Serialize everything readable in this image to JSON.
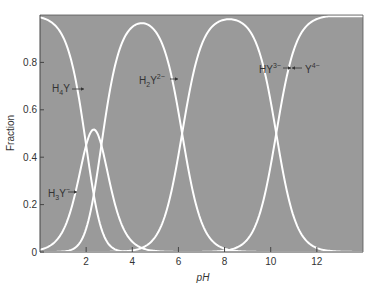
{
  "chart_data": {
    "type": "line",
    "title": "",
    "xlabel": "pH",
    "ylabel": "Fraction",
    "xlim": [
      0,
      14
    ],
    "ylim": [
      0,
      1.0
    ],
    "x_ticks": [
      "2",
      "4",
      "6",
      "8",
      "10",
      "12"
    ],
    "x_tick_values": [
      2,
      4,
      6,
      8,
      10,
      12
    ],
    "y_ticks": [
      "0",
      "0.2",
      "0.4",
      "0.6",
      "0.8"
    ],
    "y_tick_values": [
      0,
      0.2,
      0.4,
      0.6,
      0.8
    ],
    "grid": false,
    "background_color": "#9a9a9a",
    "line_color": "#ffffff",
    "pKa": [
      2.0,
      2.66,
      6.16,
      10.24
    ],
    "series": [
      {
        "name": "H4Y",
        "label_main": "H",
        "label_sub": "4",
        "label_tail": "Y",
        "label_sup": "",
        "peak": {
          "x": 0,
          "y": 0.99
        }
      },
      {
        "name": "H3Y-",
        "label_main": "H",
        "label_sub": "3",
        "label_tail": "Y",
        "label_sup": "−",
        "peak": {
          "x": 2.33,
          "y": 0.51
        }
      },
      {
        "name": "H2Y2-",
        "label_main": "H",
        "label_sub": "2",
        "label_tail": "Y",
        "label_sup": "2−",
        "peak": {
          "x": 4.41,
          "y": 0.97
        }
      },
      {
        "name": "HY3-",
        "label_main": "HY",
        "label_sub": "",
        "label_tail": "",
        "label_sup": "3−",
        "peak": {
          "x": 8.2,
          "y": 0.98
        }
      },
      {
        "name": "Y4-",
        "label_main": "Y",
        "label_sub": "",
        "label_tail": "",
        "label_sup": "4−",
        "peak": {
          "x": 14,
          "y": 1.0
        }
      }
    ],
    "annotations": [
      {
        "text": "H4Y",
        "x": 1.1,
        "y": 0.72
      },
      {
        "text": "H3Y−",
        "x": 0.7,
        "y": 0.26
      },
      {
        "text": "H2Y2−",
        "x": 4.7,
        "y": 0.72
      },
      {
        "text": "HY3−",
        "x": 8.4,
        "y": 0.77
      },
      {
        "text": "Y4−",
        "x": 11.5,
        "y": 0.77
      }
    ]
  }
}
